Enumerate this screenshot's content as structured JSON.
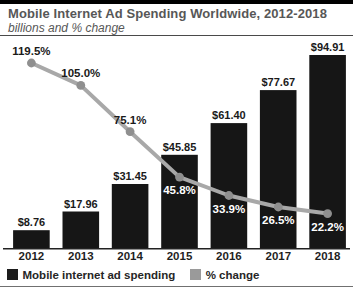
{
  "header": {
    "title": "Mobile Internet Ad Spending Worldwide, 2012-2018",
    "subtitle": "billions and % change"
  },
  "chart_data": {
    "type": "bar",
    "subtype": "bar-with-line-overlay",
    "categories": [
      "2012",
      "2013",
      "2014",
      "2015",
      "2016",
      "2017",
      "2018"
    ],
    "series": [
      {
        "name": "Mobile internet ad spending",
        "type": "bar",
        "unit": "USD billions",
        "values": [
          8.76,
          17.96,
          31.45,
          45.85,
          61.4,
          77.67,
          94.91
        ],
        "labels": [
          "$8.76",
          "$17.96",
          "$31.45",
          "$45.85",
          "$61.40",
          "$77.67",
          "$94.91"
        ],
        "color": "#161616"
      },
      {
        "name": "% change",
        "type": "line",
        "unit": "percent",
        "values": [
          119.5,
          105.0,
          75.1,
          45.8,
          33.9,
          26.5,
          22.2
        ],
        "labels": [
          "119.5%",
          "105.0%",
          "75.1%",
          "45.8%",
          "33.9%",
          "26.5%",
          "22.2%"
        ],
        "color": "#a8a8a8",
        "marker_color": "#8f8f8f"
      }
    ],
    "legend": [
      {
        "label": "Mobile internet ad spending",
        "color": "#1c1c1c"
      },
      {
        "label": "% change",
        "color": "#9a9a9a"
      }
    ],
    "title": "Mobile Internet Ad Spending Worldwide, 2012-2018",
    "subtitle": "billions and % change",
    "xlabel": "",
    "ylabel": "",
    "grid": false,
    "legend_position": "bottom-left",
    "bar_value_label_color": "#1a1a1a",
    "pct_label_color_above": "#1a1a1a",
    "pct_label_color_on_bar": "#ffffff",
    "axis_color": "#222222"
  }
}
